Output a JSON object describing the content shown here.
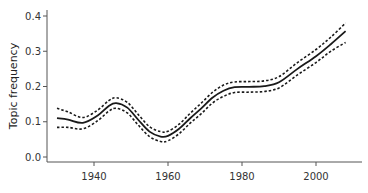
{
  "chart_data": {
    "type": "line",
    "title": "",
    "xlabel": "",
    "ylabel": "Topic frequency",
    "xlim": [
      1927,
      2012
    ],
    "ylim": [
      0.0,
      0.4
    ],
    "xticks": [
      1940,
      1960,
      1980,
      2000
    ],
    "yticks": [
      0.0,
      0.1,
      0.2,
      0.3,
      0.4
    ],
    "ytick_labels": [
      "0.0",
      "0.1",
      "0.2",
      "0.3",
      "0.4"
    ],
    "xtick_labels": [
      "1940",
      "1960",
      "1980",
      "2000"
    ],
    "grid": false,
    "legend": null,
    "x": [
      1930,
      1933,
      1937,
      1941,
      1944,
      1946,
      1949,
      1952,
      1955,
      1958,
      1960,
      1963,
      1966,
      1969,
      1972,
      1975,
      1978,
      1982,
      1986,
      1990,
      1995,
      2000,
      2004,
      2008
    ],
    "series": [
      {
        "name": "mean",
        "style": "solid",
        "values": [
          0.11,
          0.106,
          0.097,
          0.118,
          0.145,
          0.153,
          0.14,
          0.105,
          0.072,
          0.058,
          0.06,
          0.08,
          0.11,
          0.138,
          0.168,
          0.188,
          0.198,
          0.199,
          0.201,
          0.212,
          0.25,
          0.286,
          0.32,
          0.357
        ]
      },
      {
        "name": "upper bound",
        "style": "dashed",
        "values": [
          0.138,
          0.128,
          0.112,
          0.133,
          0.16,
          0.168,
          0.155,
          0.12,
          0.086,
          0.072,
          0.073,
          0.093,
          0.124,
          0.153,
          0.183,
          0.204,
          0.213,
          0.214,
          0.216,
          0.228,
          0.268,
          0.305,
          0.34,
          0.38
        ]
      },
      {
        "name": "lower bound",
        "style": "dashed",
        "values": [
          0.084,
          0.084,
          0.08,
          0.103,
          0.13,
          0.138,
          0.125,
          0.09,
          0.058,
          0.044,
          0.046,
          0.066,
          0.096,
          0.123,
          0.153,
          0.172,
          0.183,
          0.184,
          0.186,
          0.196,
          0.233,
          0.268,
          0.3,
          0.325
        ]
      }
    ]
  },
  "colors": {
    "line": "#1a1a1a",
    "axis": "#555555"
  }
}
